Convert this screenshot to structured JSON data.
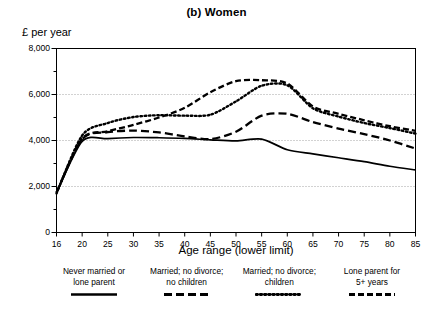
{
  "chart_data": {
    "type": "line",
    "title": "(b) Women",
    "ylabel": "£ per year",
    "xlabel": "Age range (lower limit)",
    "xlim": [
      16,
      85
    ],
    "ylim": [
      0,
      8000
    ],
    "grid": "horizontal-dotted",
    "legend_position": "below",
    "ytick_labels": [
      "0",
      "2,000",
      "4,000",
      "6,000",
      "8,000"
    ],
    "ytick_values": [
      0,
      2000,
      4000,
      6000,
      8000
    ],
    "yminor_values": [
      1000,
      3000,
      5000,
      7000
    ],
    "gridline_values": [
      2000,
      4000,
      6000
    ],
    "xtick_labels": [
      "16",
      "20",
      "25",
      "30",
      "35",
      "40",
      "45",
      "50",
      "55",
      "60",
      "65",
      "70",
      "75",
      "80",
      "85"
    ],
    "x": [
      16,
      20,
      25,
      30,
      35,
      40,
      45,
      50,
      55,
      60,
      65,
      70,
      75,
      80,
      85
    ],
    "series": [
      {
        "name": "Never married or lone parent",
        "style": "solid",
        "values": [
          1720,
          3960,
          4080,
          4130,
          4120,
          4090,
          4030,
          3980,
          4060,
          3600,
          3420,
          3250,
          3080,
          2880,
          2720
        ]
      },
      {
        "name": "Married; no divorce; no children",
        "style": "dashed",
        "values": [
          1740,
          4060,
          4360,
          4430,
          4350,
          4180,
          4060,
          4380,
          5080,
          5160,
          4800,
          4520,
          4280,
          4000,
          3650
        ]
      },
      {
        "name": "Married; no divorce; children",
        "style": "dotted",
        "values": [
          1700,
          4220,
          4760,
          5020,
          5100,
          5080,
          5120,
          5700,
          6380,
          6400,
          5400,
          5040,
          4760,
          4540,
          4300
        ]
      },
      {
        "name": "Lone parent for 5+ years",
        "style": "dash-dot",
        "values": [
          1730,
          4080,
          4400,
          4680,
          5000,
          5420,
          6100,
          6580,
          6620,
          6480,
          5480,
          5160,
          4880,
          4620,
          4420
        ]
      }
    ]
  },
  "legend": {
    "entries": [
      {
        "line1": "Never married or",
        "line2": "lone parent",
        "style": "solid"
      },
      {
        "line1": "Married; no divorce;",
        "line2": "no children",
        "style": "dashed"
      },
      {
        "line1": "Married; no divorce;",
        "line2": "children",
        "style": "dotted"
      },
      {
        "line1": "Lone parent for",
        "line2": "5+ years",
        "style": "dash-dot"
      }
    ]
  },
  "colors": {
    "ink": "#000000",
    "background": "#ffffff",
    "gridline": "#9a9a9a"
  }
}
